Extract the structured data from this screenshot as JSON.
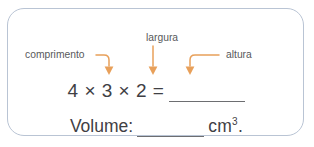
{
  "card": {
    "border_color": "#b9c4d4",
    "background": "#ffffff"
  },
  "callouts": {
    "arrow_color": "#e8a05a",
    "label_color": "#58595b",
    "items": [
      {
        "id": "comprimento",
        "label": "comprimento",
        "arrow": "elbow-right-down",
        "points_to": "4"
      },
      {
        "id": "largura",
        "label": "largura",
        "arrow": "straight-down",
        "points_to": "3"
      },
      {
        "id": "altura",
        "label": "altura",
        "arrow": "elbow-left-down",
        "points_to": "2"
      }
    ]
  },
  "equation": {
    "text": "4 × 3 × 2 =",
    "blank": "",
    "text_color": "#3f4044"
  },
  "volume": {
    "label": "Volume:",
    "blank": "",
    "unit": "cm",
    "unit_exponent": "3",
    "terminator": "."
  }
}
